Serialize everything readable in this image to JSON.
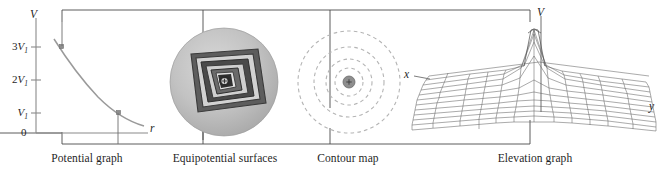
{
  "figure": {
    "panels": [
      {
        "id": "potential-graph",
        "caption": "Potential graph"
      },
      {
        "id": "equipotential-surfaces",
        "caption": "Equipotential surfaces"
      },
      {
        "id": "contour-map",
        "caption": "Contour map"
      },
      {
        "id": "elevation-graph",
        "caption": "Elevation graph"
      }
    ]
  },
  "potential_graph": {
    "y_axis_label": "V",
    "x_axis_label": "r",
    "origin_label": "0",
    "ticks": [
      {
        "prefix": "3",
        "symbol": "V",
        "sub": "1"
      },
      {
        "prefix": "2",
        "symbol": "V",
        "sub": "1"
      },
      {
        "prefix": "",
        "symbol": "V",
        "sub": "1"
      }
    ],
    "curve_note": "1/r decay curve with two square markers"
  },
  "equipotential_surfaces": {
    "charge_symbol": "+",
    "band_count": 5
  },
  "contour_map": {
    "charge_symbol": "+",
    "contour_count": 4,
    "line_style": "dashed"
  },
  "elevation_graph": {
    "v_axis_label": "V",
    "x_axis_label": "x",
    "y_axis_label": "y",
    "surface_note": "mesh surface with central peak"
  },
  "colors": {
    "ink": "#1f1f1f",
    "line": "#6e6e6e",
    "curve": "#8a8a8a",
    "bracket": "#4a4a4a",
    "disc_outer": "#b9b9b9",
    "band_dark": "#3a3a3a",
    "band_mid": "#7c7c7c",
    "band_light": "#d6d6d6",
    "contour_dash": "#b0b0b0",
    "mesh": "#5a5a5a",
    "charge_fill": "#8e8e8e"
  }
}
